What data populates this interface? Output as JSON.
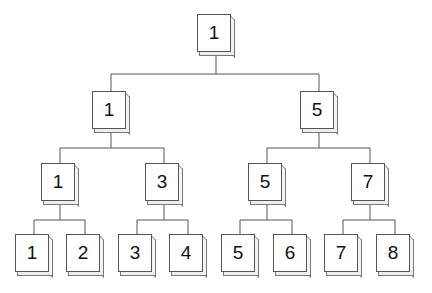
{
  "diagram": {
    "type": "binary-tree",
    "levels": [
      {
        "nodes": [
          {
            "id": "n0",
            "label": "1",
            "x": 197,
            "y": 14
          }
        ]
      },
      {
        "nodes": [
          {
            "id": "n1",
            "label": "1",
            "x": 92,
            "y": 91
          },
          {
            "id": "n2",
            "label": "5",
            "x": 300,
            "y": 91
          }
        ]
      },
      {
        "nodes": [
          {
            "id": "n3",
            "label": "1",
            "x": 41,
            "y": 163
          },
          {
            "id": "n4",
            "label": "3",
            "x": 145,
            "y": 163
          },
          {
            "id": "n5",
            "label": "5",
            "x": 248,
            "y": 163
          },
          {
            "id": "n6",
            "label": "7",
            "x": 351,
            "y": 163
          }
        ]
      },
      {
        "nodes": [
          {
            "id": "n7",
            "label": "1",
            "x": 15,
            "y": 234
          },
          {
            "id": "n8",
            "label": "2",
            "x": 66,
            "y": 234
          },
          {
            "id": "n9",
            "label": "3",
            "x": 118,
            "y": 234
          },
          {
            "id": "n10",
            "label": "4",
            "x": 169,
            "y": 234
          },
          {
            "id": "n11",
            "label": "5",
            "x": 221,
            "y": 234
          },
          {
            "id": "n12",
            "label": "6",
            "x": 273,
            "y": 234
          },
          {
            "id": "n13",
            "label": "7",
            "x": 324,
            "y": 234
          },
          {
            "id": "n14",
            "label": "8",
            "x": 376,
            "y": 234
          }
        ]
      }
    ],
    "edges": [
      [
        "n0",
        "n1"
      ],
      [
        "n0",
        "n2"
      ],
      [
        "n1",
        "n3"
      ],
      [
        "n1",
        "n4"
      ],
      [
        "n2",
        "n5"
      ],
      [
        "n2",
        "n6"
      ],
      [
        "n3",
        "n7"
      ],
      [
        "n3",
        "n8"
      ],
      [
        "n4",
        "n9"
      ],
      [
        "n4",
        "n10"
      ],
      [
        "n5",
        "n11"
      ],
      [
        "n5",
        "n12"
      ],
      [
        "n6",
        "n13"
      ],
      [
        "n6",
        "n14"
      ]
    ],
    "colors": {
      "line": "#555555",
      "face": "#ffffff",
      "text": "#111111"
    }
  }
}
